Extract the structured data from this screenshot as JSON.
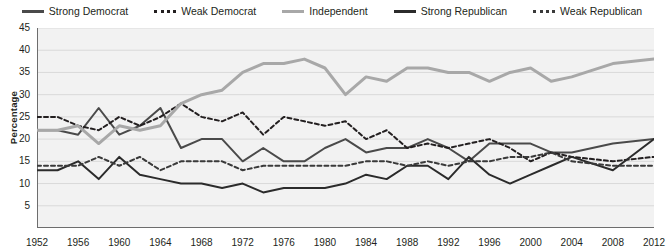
{
  "legend": {
    "items": [
      {
        "label": "Strong Democrat",
        "style": "solid",
        "color": "#4a4a4a"
      },
      {
        "label": "Weak Democrat",
        "style": "dashed",
        "color": "#231f20"
      },
      {
        "label": "Independent",
        "style": "solid",
        "color": "#a8a8a8"
      },
      {
        "label": "Strong Republican",
        "style": "solid",
        "color": "#2b2b2b"
      },
      {
        "label": "Weak Republican",
        "style": "dashed",
        "color": "#3a3a3a"
      }
    ]
  },
  "axes": {
    "y_title": "Percentage",
    "y_ticks": [
      45,
      40,
      35,
      30,
      25,
      20,
      15,
      10,
      5
    ],
    "x_ticks": [
      1952,
      1956,
      1960,
      1964,
      1968,
      1972,
      1976,
      1980,
      1984,
      1988,
      1992,
      1996,
      2000,
      2004,
      2008,
      2012
    ]
  },
  "chart_data": {
    "type": "line",
    "title": "",
    "xlabel": "",
    "ylabel": "Percentage",
    "xlim": [
      1952,
      2012
    ],
    "ylim": [
      0,
      45
    ],
    "grid": true,
    "legend_position": "top",
    "x": [
      1952,
      1954,
      1956,
      1958,
      1960,
      1962,
      1964,
      1966,
      1968,
      1970,
      1972,
      1974,
      1976,
      1978,
      1980,
      1982,
      1984,
      1986,
      1988,
      1990,
      1992,
      1994,
      1996,
      1998,
      2000,
      2002,
      2004,
      2008,
      2012
    ],
    "series": [
      {
        "name": "Strong Democrat",
        "style": "solid",
        "color": "#4a4a4a",
        "values": [
          22,
          22,
          21,
          27,
          21,
          23,
          27,
          18,
          20,
          20,
          15,
          18,
          15,
          15,
          18,
          20,
          17,
          18,
          18,
          20,
          18,
          15,
          19,
          19,
          19,
          17,
          17,
          19,
          20
        ]
      },
      {
        "name": "Weak Democrat",
        "style": "dashed",
        "color": "#231f20",
        "values": [
          25,
          25,
          23,
          22,
          25,
          23,
          25,
          28,
          25,
          24,
          26,
          21,
          25,
          24,
          23,
          24,
          20,
          22,
          18,
          19,
          18,
          19,
          20,
          18,
          15,
          17,
          16,
          15,
          16
        ]
      },
      {
        "name": "Independent",
        "style": "solid",
        "color": "#a8a8a8",
        "values": [
          22,
          22,
          23,
          19,
          23,
          22,
          23,
          28,
          30,
          31,
          35,
          37,
          37,
          38,
          36,
          30,
          34,
          33,
          36,
          36,
          35,
          35,
          33,
          35,
          36,
          33,
          34,
          37,
          38
        ]
      },
      {
        "name": "Strong Republican",
        "style": "solid",
        "color": "#2b2b2b",
        "values": [
          13,
          13,
          15,
          11,
          16,
          12,
          11,
          10,
          10,
          9,
          10,
          8,
          9,
          9,
          9,
          10,
          12,
          11,
          14,
          14,
          11,
          16,
          12,
          10,
          12,
          14,
          16,
          13,
          20
        ]
      },
      {
        "name": "Weak Republican",
        "style": "dashed",
        "color": "#3a3a3a",
        "values": [
          14,
          14,
          14,
          16,
          14,
          16,
          13,
          15,
          15,
          15,
          13,
          14,
          14,
          14,
          14,
          14,
          15,
          15,
          14,
          15,
          14,
          15,
          15,
          16,
          16,
          17,
          15,
          14,
          14
        ]
      }
    ]
  }
}
